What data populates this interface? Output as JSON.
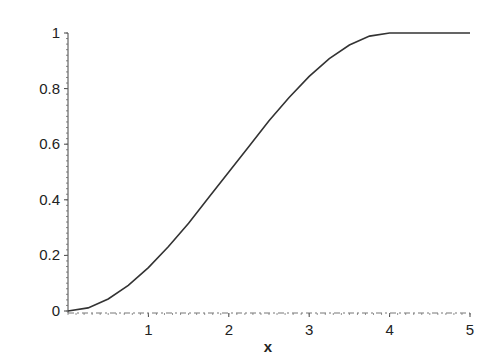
{
  "chart_data": {
    "type": "line",
    "title": "",
    "xlabel": "x",
    "ylabel": "",
    "xlim": [
      0,
      5
    ],
    "ylim": [
      0,
      1
    ],
    "grid": false,
    "x_ticks": [
      "1",
      "2",
      "3",
      "4",
      "5"
    ],
    "y_ticks": [
      "0",
      "0.2",
      "0.4",
      "0.6",
      "0.8",
      "1"
    ],
    "series": [
      {
        "name": "curve",
        "x": [
          0,
          0.25,
          0.5,
          0.75,
          1,
          1.25,
          1.5,
          1.75,
          2,
          2.25,
          2.5,
          2.75,
          3,
          3.25,
          3.5,
          3.75,
          4,
          4.5,
          5
        ],
        "values": [
          0,
          0.011,
          0.043,
          0.092,
          0.156,
          0.232,
          0.316,
          0.408,
          0.5,
          0.592,
          0.684,
          0.768,
          0.844,
          0.908,
          0.957,
          0.989,
          1,
          1,
          1
        ]
      }
    ],
    "color": "#333333"
  }
}
